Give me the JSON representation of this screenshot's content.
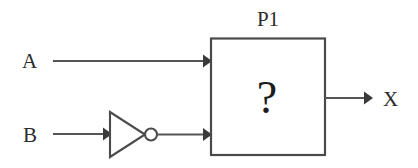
{
  "diagram": {
    "type": "logic-circuit-schematic",
    "background_color": "#ffffff",
    "line_color": "#555555",
    "text_color": "#2b2b2b",
    "inputs": [
      {
        "label": "A",
        "feeds": "P1",
        "inverted": "false"
      },
      {
        "label": "B",
        "feeds": "P1",
        "inverted": "true"
      }
    ],
    "gates": [
      {
        "name": "inverter",
        "symbol": "NOT",
        "bubble": "true"
      }
    ],
    "block": {
      "label": "P1",
      "glyph": "?",
      "description": "unknown-logic-block"
    },
    "outputs": [
      {
        "label": "X",
        "from": "P1"
      }
    ]
  },
  "labels": {
    "input_a": "A",
    "input_b": "B",
    "block_name": "P1",
    "block_glyph": "?",
    "output_x": "X"
  }
}
